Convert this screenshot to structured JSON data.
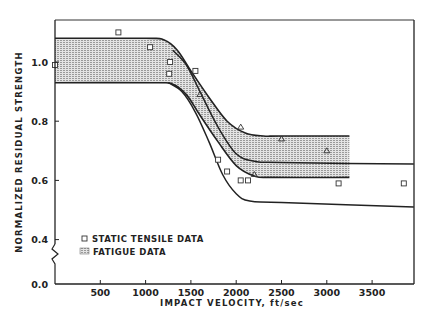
{
  "chart_data": {
    "type": "line",
    "title": "",
    "xlabel": "IMPACT VELOCITY, ft/sec",
    "ylabel": "NORMALIZED RESIDUAL STRENGTH",
    "xlim": [
      0,
      3960
    ],
    "ylim": [
      0.0,
      1.13
    ],
    "y_axis_break": true,
    "grid": false,
    "x_ticks": [
      500,
      1000,
      1500,
      2000,
      2500,
      3000,
      3500
    ],
    "x_tick_labels": [
      "500",
      "1000",
      "1500",
      "2000",
      "2500",
      "3000",
      "3500"
    ],
    "y_ticks": [
      0.0,
      0.4,
      0.6,
      0.8,
      1.0
    ],
    "y_tick_labels": [
      "0.0",
      "0.4",
      "0.6",
      "0.8",
      "1.0"
    ],
    "legend": {
      "position": "lower-left",
      "entries": [
        {
          "label": "STATIC TENSILE DATA",
          "marker": "square"
        },
        {
          "label": "FATIGUE DATA",
          "marker": "hatched-band"
        }
      ]
    },
    "series": [
      {
        "name": "Fatigue data band (upper bound)",
        "type": "line",
        "x": [
          0,
          1000,
          1200,
          1350,
          1500,
          1700,
          1900,
          2100,
          2300,
          2500,
          3250
        ],
        "y": [
          1.08,
          1.08,
          1.075,
          1.04,
          0.97,
          0.88,
          0.8,
          0.76,
          0.75,
          0.75,
          0.75
        ]
      },
      {
        "name": "Fatigue data band (lower bound)",
        "type": "line",
        "x": [
          0,
          1100,
          1300,
          1450,
          1600,
          1800,
          2000,
          2200,
          2400,
          3250
        ],
        "y": [
          0.93,
          0.93,
          0.925,
          0.89,
          0.82,
          0.73,
          0.65,
          0.615,
          0.61,
          0.61
        ]
      },
      {
        "name": "Static tensile upper curve",
        "type": "line",
        "x": [
          1300,
          1450,
          1600,
          1800,
          2000,
          2200,
          2500,
          3960
        ],
        "y": [
          1.04,
          0.99,
          0.9,
          0.78,
          0.69,
          0.665,
          0.66,
          0.655
        ]
      },
      {
        "name": "Static tensile lower curve",
        "type": "line",
        "x": [
          1250,
          1400,
          1550,
          1700,
          1850,
          2000,
          2150,
          2500,
          3960
        ],
        "y": [
          0.93,
          0.9,
          0.83,
          0.73,
          0.62,
          0.555,
          0.53,
          0.525,
          0.51
        ]
      },
      {
        "name": "STATIC TENSILE DATA",
        "type": "scatter",
        "marker": "square",
        "x": [
          0,
          700,
          1050,
          1270,
          1260,
          1550,
          1800,
          1900,
          2050,
          2130,
          3130,
          3850
        ],
        "y": [
          0.99,
          1.1,
          1.05,
          1.0,
          0.96,
          0.97,
          0.67,
          0.63,
          0.6,
          0.6,
          0.59,
          0.59
        ]
      },
      {
        "name": "FATIGUE DATA",
        "type": "scatter",
        "marker": "triangle",
        "x": [
          1600,
          2050,
          2200,
          2500,
          3000
        ],
        "y": [
          0.89,
          0.78,
          0.62,
          0.74,
          0.7
        ]
      }
    ]
  },
  "labels": {
    "xlabel": "IMPACT VELOCITY, ft/sec",
    "ylabel": "NORMALIZED RESIDUAL STRENGTH",
    "legend_static": "STATIC TENSILE DATA",
    "legend_fatigue": "FATIGUE DATA",
    "xticks": [
      "500",
      "1000",
      "1500",
      "2000",
      "2500",
      "3000",
      "3500"
    ],
    "yticks": [
      "0.0",
      "0.4",
      "0.6",
      "0.8",
      "1.0"
    ]
  },
  "colors": {
    "ink": "#222222",
    "band_fill": "#c8c8c8",
    "background": "#ffffff"
  }
}
